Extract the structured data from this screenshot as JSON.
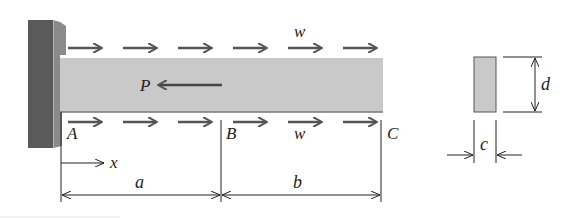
{
  "figure": {
    "type": "cantilever beam with axial load",
    "labels": {
      "load_top": "w",
      "load_bottom": "w",
      "point_force": "P",
      "point_a": "A",
      "point_b": "B",
      "point_c": "C",
      "axis_x": "x",
      "length_a": "a",
      "length_b": "b",
      "section_width": "c",
      "section_height": "d"
    },
    "distributed_load_arrows_top": 6,
    "distributed_load_arrows_bottom": 6,
    "colors": {
      "wall_front": "#5a5a5a",
      "wall_side": "#8a8a8a",
      "beam_fill": "#c9c9c9",
      "arrow": "#555555",
      "line": "#222222"
    }
  }
}
